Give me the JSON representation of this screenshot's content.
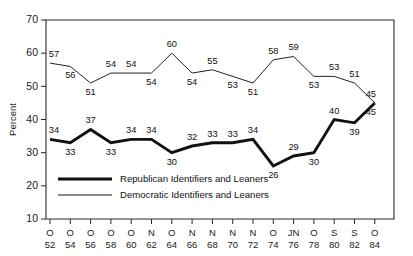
{
  "chart_data": {
    "type": "line",
    "title": "",
    "xlabel": "",
    "ylabel": "Percent",
    "ylim": [
      10,
      70
    ],
    "yticks": [
      10,
      20,
      30,
      40,
      50,
      60,
      70
    ],
    "grid": false,
    "legend_position": "inside-lower-left",
    "categories": [
      "O 52",
      "O 54",
      "O 56",
      "O 58",
      "O 60",
      "N 62",
      "O 64",
      "N 66",
      "N 68",
      "N 70",
      "N 72",
      "O 74",
      "JN 76",
      "O 78",
      "S 80",
      "S 82",
      "O 84"
    ],
    "x_tick_months": [
      "O",
      "O",
      "O",
      "O",
      "O",
      "N",
      "O",
      "N",
      "N",
      "N",
      "N",
      "O",
      "JN",
      "O",
      "S",
      "S",
      "O"
    ],
    "x_tick_years": [
      "52",
      "54",
      "56",
      "58",
      "60",
      "62",
      "64",
      "66",
      "68",
      "70",
      "72",
      "74",
      "76",
      "78",
      "80",
      "82",
      "84"
    ],
    "series": [
      {
        "name": "Republican Identifiers and Leaners",
        "style": "thick",
        "color": "#111111",
        "values": [
          34,
          33,
          37,
          33,
          34,
          34,
          30,
          32,
          33,
          33,
          34,
          26,
          29,
          30,
          40,
          39,
          45
        ],
        "label_positions": [
          "above",
          "below",
          "above",
          "below",
          "above",
          "above",
          "below",
          "above",
          "above",
          "above",
          "above",
          "below",
          "above",
          "below",
          "above",
          "below",
          "below"
        ]
      },
      {
        "name": "Democratic Identifiers and Leaners",
        "style": "thin",
        "color": "#222222",
        "values": [
          57,
          56,
          51,
          54,
          54,
          54,
          60,
          54,
          55,
          53,
          51,
          58,
          59,
          53,
          53,
          51,
          45
        ],
        "label_positions": [
          "above",
          "below",
          "below",
          "above",
          "above",
          "below",
          "above",
          "below",
          "above",
          "below",
          "below",
          "above",
          "above",
          "below",
          "above",
          "above",
          "above"
        ]
      }
    ],
    "legend": [
      {
        "label": "Republican Identifiers and Leaners",
        "style": "thick"
      },
      {
        "label": "Democratic Identifiers and Leaners",
        "style": "thin"
      }
    ]
  }
}
